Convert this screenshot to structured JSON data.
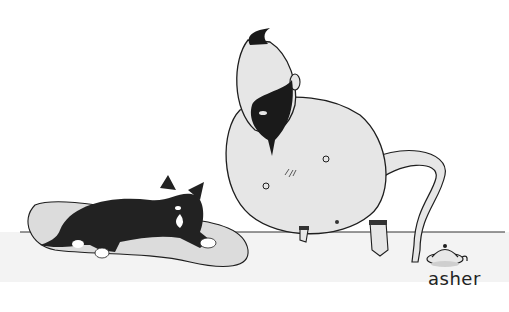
{
  "cartoon": {
    "description": "Single-panel cartoon: a bald genie with a topknot and black beard emerges from a small lamp, leaning over a table toward a black-and-white cat lounging on a pillow.",
    "signature": "asher",
    "elements": [
      "genie",
      "magic-lamp",
      "cat",
      "pillow",
      "table-edge"
    ]
  },
  "colors": {
    "background": "#ffffff",
    "skin": "#e6e6e6",
    "beard": "#1a1a1a",
    "cat": "#222222",
    "pillow": "#dcdcdc",
    "line": "#1e1e1e",
    "table_shadow": "#f0f0f0"
  }
}
